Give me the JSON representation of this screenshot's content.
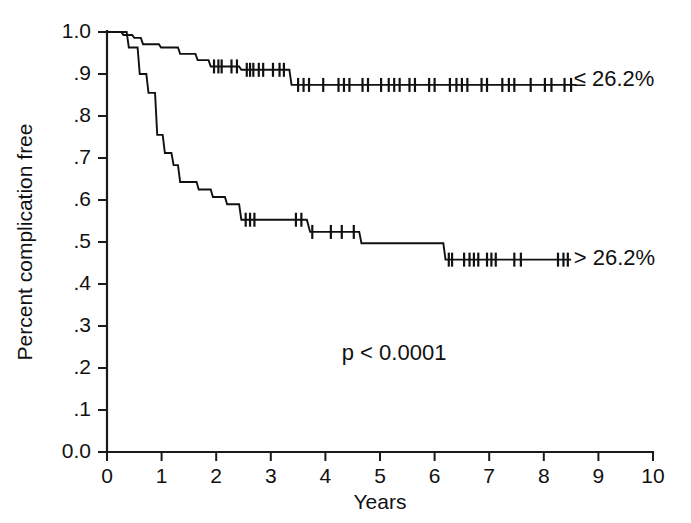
{
  "chart_data": {
    "type": "line",
    "title": "",
    "xlabel": "Years",
    "ylabel": "Percent complication free",
    "xlim": [
      0,
      10
    ],
    "ylim": [
      0,
      1.0
    ],
    "grid": false,
    "legend_position": "right-inline",
    "xticks": [
      "0",
      "1",
      "2",
      "3",
      "4",
      "5",
      "6",
      "7",
      "8",
      "9",
      "10"
    ],
    "xtick_values": [
      0,
      1,
      2,
      3,
      4,
      5,
      6,
      7,
      8,
      9,
      10
    ],
    "yticks": [
      "0.0",
      ".1",
      ".2",
      ".3",
      ".4",
      ".5",
      ".6",
      ".7",
      ".8",
      ".9",
      "1.0"
    ],
    "ytick_values": [
      0.0,
      0.1,
      0.2,
      0.3,
      0.4,
      0.5,
      0.6,
      0.7,
      0.8,
      0.9,
      1.0
    ],
    "annotations": [
      {
        "name": "p-value",
        "text": "p < 0.0001",
        "x": 4.3,
        "y": 0.22
      }
    ],
    "series": [
      {
        "name": "low-risk-group",
        "label": "≤ 26.2%",
        "label_x": 8.55,
        "label_y": 0.886,
        "color": "#111111",
        "steps": [
          [
            0.0,
            1.0
          ],
          [
            0.26,
            1.0
          ],
          [
            0.3,
            0.993
          ],
          [
            0.46,
            0.993
          ],
          [
            0.5,
            0.986
          ],
          [
            0.62,
            0.986
          ],
          [
            0.66,
            0.971
          ],
          [
            0.95,
            0.971
          ],
          [
            0.99,
            0.963
          ],
          [
            1.3,
            0.963
          ],
          [
            1.34,
            0.948
          ],
          [
            1.62,
            0.948
          ],
          [
            1.66,
            0.933
          ],
          [
            1.86,
            0.933
          ],
          [
            1.9,
            0.918
          ],
          [
            2.42,
            0.918
          ],
          [
            2.46,
            0.91
          ],
          [
            3.34,
            0.91
          ],
          [
            3.38,
            0.874
          ],
          [
            8.6,
            0.874
          ]
        ],
        "censors": [
          [
            1.96,
            0.918
          ],
          [
            2.04,
            0.918
          ],
          [
            2.1,
            0.918
          ],
          [
            2.28,
            0.918
          ],
          [
            2.38,
            0.918
          ],
          [
            2.56,
            0.91
          ],
          [
            2.62,
            0.91
          ],
          [
            2.68,
            0.91
          ],
          [
            2.78,
            0.91
          ],
          [
            2.86,
            0.91
          ],
          [
            3.04,
            0.91
          ],
          [
            3.16,
            0.91
          ],
          [
            3.24,
            0.91
          ],
          [
            3.5,
            0.874
          ],
          [
            3.6,
            0.874
          ],
          [
            3.7,
            0.874
          ],
          [
            3.96,
            0.874
          ],
          [
            4.24,
            0.874
          ],
          [
            4.34,
            0.874
          ],
          [
            4.44,
            0.874
          ],
          [
            4.68,
            0.874
          ],
          [
            4.78,
            0.874
          ],
          [
            5.02,
            0.874
          ],
          [
            5.16,
            0.874
          ],
          [
            5.26,
            0.874
          ],
          [
            5.36,
            0.874
          ],
          [
            5.54,
            0.874
          ],
          [
            5.64,
            0.874
          ],
          [
            5.9,
            0.874
          ],
          [
            6.0,
            0.874
          ],
          [
            6.28,
            0.874
          ],
          [
            6.4,
            0.874
          ],
          [
            6.5,
            0.874
          ],
          [
            6.6,
            0.874
          ],
          [
            6.86,
            0.874
          ],
          [
            6.96,
            0.874
          ],
          [
            7.24,
            0.874
          ],
          [
            7.36,
            0.874
          ],
          [
            7.46,
            0.874
          ],
          [
            7.76,
            0.874
          ],
          [
            8.02,
            0.874
          ],
          [
            8.14,
            0.874
          ],
          [
            8.38,
            0.874
          ],
          [
            8.5,
            0.874
          ]
        ]
      },
      {
        "name": "high-risk-group",
        "label": "> 26.2%",
        "label_x": 8.55,
        "label_y": 0.458,
        "color": "#111111",
        "steps": [
          [
            0.0,
            1.0
          ],
          [
            0.36,
            1.0
          ],
          [
            0.4,
            0.963
          ],
          [
            0.56,
            0.963
          ],
          [
            0.6,
            0.9
          ],
          [
            0.72,
            0.9
          ],
          [
            0.76,
            0.855
          ],
          [
            0.88,
            0.855
          ],
          [
            0.92,
            0.755
          ],
          [
            1.02,
            0.755
          ],
          [
            1.06,
            0.712
          ],
          [
            1.18,
            0.712
          ],
          [
            1.22,
            0.683
          ],
          [
            1.3,
            0.683
          ],
          [
            1.34,
            0.643
          ],
          [
            1.64,
            0.643
          ],
          [
            1.68,
            0.625
          ],
          [
            1.9,
            0.625
          ],
          [
            1.94,
            0.607
          ],
          [
            2.16,
            0.607
          ],
          [
            2.2,
            0.59
          ],
          [
            2.42,
            0.59
          ],
          [
            2.46,
            0.553
          ],
          [
            3.62,
            0.553
          ],
          [
            3.66,
            0.553
          ],
          [
            3.72,
            0.524
          ],
          [
            4.62,
            0.524
          ],
          [
            4.66,
            0.497
          ],
          [
            6.16,
            0.497
          ],
          [
            6.2,
            0.458
          ],
          [
            8.5,
            0.458
          ]
        ],
        "censors": [
          [
            2.54,
            0.553
          ],
          [
            2.62,
            0.553
          ],
          [
            2.7,
            0.553
          ],
          [
            3.46,
            0.553
          ],
          [
            3.56,
            0.553
          ],
          [
            3.76,
            0.524
          ],
          [
            4.1,
            0.524
          ],
          [
            4.3,
            0.524
          ],
          [
            4.52,
            0.524
          ],
          [
            6.26,
            0.458
          ],
          [
            6.32,
            0.458
          ],
          [
            6.54,
            0.458
          ],
          [
            6.64,
            0.458
          ],
          [
            6.72,
            0.458
          ],
          [
            6.8,
            0.458
          ],
          [
            6.96,
            0.458
          ],
          [
            7.04,
            0.458
          ],
          [
            7.12,
            0.458
          ],
          [
            7.46,
            0.458
          ],
          [
            7.58,
            0.458
          ],
          [
            8.26,
            0.458
          ],
          [
            8.36,
            0.458
          ],
          [
            8.44,
            0.458
          ]
        ]
      }
    ]
  }
}
